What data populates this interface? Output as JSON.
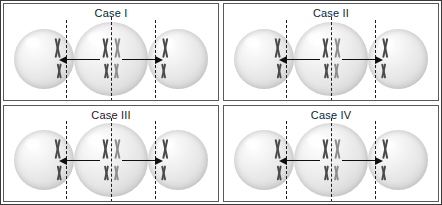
{
  "figure": {
    "border_color": "#3a3a3a",
    "background_color": "#ffffff",
    "chromosome_color": "#6f6f6f",
    "arrow_color": "#101010",
    "division_plane_color": "#1d1d1d"
  },
  "panels": [
    {
      "id": "case-1",
      "label": "Case I",
      "parent_cell": {
        "name": "parent-cell",
        "groups": [
          {
            "position": "upper",
            "chromosomes": 2,
            "size": "large"
          },
          {
            "position": "lower",
            "chromosomes": 2,
            "size": "small"
          }
        ]
      },
      "left_daughter": {
        "name": "left-daughter-cell",
        "groups": [
          {
            "position": "upper",
            "chromosomes": 1,
            "size": "large"
          },
          {
            "position": "lower",
            "chromosomes": 1,
            "size": "small"
          }
        ]
      },
      "right_daughter": {
        "name": "right-daughter-cell",
        "groups": [
          {
            "position": "upper",
            "chromosomes": 1,
            "size": "large"
          },
          {
            "position": "lower",
            "chromosomes": 1,
            "size": "small"
          }
        ]
      },
      "left_arrow": "left-arrow",
      "right_arrow": "right-arrow"
    },
    {
      "id": "case-2",
      "label": "Case II",
      "parent_cell": {
        "name": "parent-cell",
        "groups": [
          {
            "position": "upper",
            "chromosomes": 2,
            "size": "large"
          },
          {
            "position": "lower",
            "chromosomes": 2,
            "size": "small"
          }
        ]
      },
      "left_daughter": {
        "name": "left-daughter-cell",
        "groups": [
          {
            "position": "upper",
            "chromosomes": 1,
            "size": "large"
          },
          {
            "position": "lower",
            "chromosomes": 1,
            "size": "small"
          }
        ]
      },
      "right_daughter": {
        "name": "right-daughter-cell",
        "groups": [
          {
            "position": "upper",
            "chromosomes": 1,
            "size": "large"
          },
          {
            "position": "lower",
            "chromosomes": 1,
            "size": "small"
          }
        ]
      },
      "left_arrow": "left-arrow",
      "right_arrow": "right-arrow"
    },
    {
      "id": "case-3",
      "label": "Case III",
      "parent_cell": {
        "name": "parent-cell",
        "groups": [
          {
            "position": "upper",
            "chromosomes": 2,
            "size": "large"
          },
          {
            "position": "lower",
            "chromosomes": 2,
            "size": "small"
          }
        ]
      },
      "left_daughter": {
        "name": "left-daughter-cell",
        "groups": [
          {
            "position": "upper",
            "chromosomes": 1,
            "size": "large"
          },
          {
            "position": "lower",
            "chromosomes": 1,
            "size": "small"
          }
        ]
      },
      "right_daughter": {
        "name": "right-daughter-cell",
        "groups": [
          {
            "position": "upper",
            "chromosomes": 1,
            "size": "large"
          },
          {
            "position": "lower",
            "chromosomes": 1,
            "size": "small"
          }
        ]
      },
      "left_arrow": "left-arrow",
      "right_arrow": "right-arrow"
    },
    {
      "id": "case-4",
      "label": "Case IV",
      "parent_cell": {
        "name": "parent-cell",
        "groups": [
          {
            "position": "upper",
            "chromosomes": 2,
            "size": "large"
          },
          {
            "position": "lower",
            "chromosomes": 2,
            "size": "small"
          }
        ]
      },
      "left_daughter": {
        "name": "left-daughter-cell",
        "groups": [
          {
            "position": "upper",
            "chromosomes": 1,
            "size": "large"
          },
          {
            "position": "lower",
            "chromosomes": 1,
            "size": "small"
          }
        ]
      },
      "right_daughter": {
        "name": "right-daughter-cell",
        "groups": [
          {
            "position": "upper",
            "chromosomes": 1,
            "size": "large"
          },
          {
            "position": "lower",
            "chromosomes": 1,
            "size": "small"
          }
        ]
      },
      "left_arrow": "left-arrow",
      "right_arrow": "right-arrow"
    }
  ]
}
